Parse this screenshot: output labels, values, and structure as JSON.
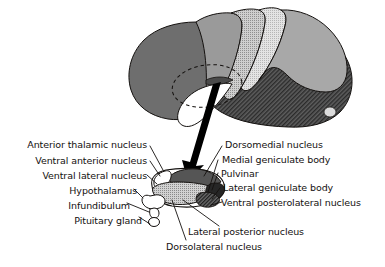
{
  "figure": {
    "type": "anatomical-illustration",
    "background_color": "#ffffff",
    "ink_color": "#14110f"
  },
  "brain": {
    "name": "lateral view of cerebral hemisphere",
    "callout_marker": "dashed ellipse over thalamus region",
    "pointer": "thick black arrow from brain to thalamus detail",
    "regions": [
      {
        "name": "frontal-lobe",
        "fill": "#6e6e6e"
      },
      {
        "name": "premotor-band",
        "fill": "#9a9a9a"
      },
      {
        "name": "precentral-band",
        "fill": "#c2c2c2"
      },
      {
        "name": "postcentral-band",
        "fill": "#dedede"
      },
      {
        "name": "parietal-lobe",
        "fill": "#a8a8a8"
      },
      {
        "name": "occipital-temporal-hatched",
        "fill": "#4a4a4a"
      },
      {
        "name": "brainstem-white",
        "fill": "#ffffff"
      }
    ]
  },
  "thalamus": {
    "name": "thalamus detail",
    "parts": [
      {
        "name": "dorsomedial-nucleus",
        "fill": "#5a5a5a"
      },
      {
        "name": "anterior-thalamic-nucleus",
        "fill": "#ffffff"
      },
      {
        "name": "ventral-lateral-nucleus",
        "fill": "#b8b8b8"
      },
      {
        "name": "lateral-posterior-nucleus",
        "fill": "#cfcfcf"
      },
      {
        "name": "pulvinar",
        "fill": "#2a2a2a"
      },
      {
        "name": "geniculate-bodies",
        "fill": "#3a3a3a"
      },
      {
        "name": "hypothalamus",
        "fill": "#ffffff"
      },
      {
        "name": "infundibulum",
        "fill": "#ffffff"
      },
      {
        "name": "pituitary-gland",
        "fill": "#ffffff"
      }
    ]
  },
  "labels_left": [
    {
      "id": "anterior-thalamic-nucleus",
      "text": "Anterior thalamic nucleus"
    },
    {
      "id": "ventral-anterior-nucleus",
      "text": "Ventral anterior nucleus"
    },
    {
      "id": "ventral-lateral-nucleus",
      "text": "Ventral lateral nucleus"
    },
    {
      "id": "hypothalamus",
      "text": "Hypothalamus"
    },
    {
      "id": "infundibulum",
      "text": "Infundibulum"
    },
    {
      "id": "pituitary-gland",
      "text": "Pituitary gland"
    }
  ],
  "labels_right": [
    {
      "id": "dorsomedial-nucleus",
      "text": "Dorsomedial nucleus"
    },
    {
      "id": "medial-geniculate-body",
      "text": "Medial geniculate body"
    },
    {
      "id": "pulvinar",
      "text": "Pulvinar"
    },
    {
      "id": "lateral-geniculate-body",
      "text": "Lateral geniculate body"
    },
    {
      "id": "ventral-posterolateral-nucleus",
      "text": "Ventral posterolateral nucleus"
    },
    {
      "id": "lateral-posterior-nucleus",
      "text": "Lateral posterior nucleus"
    },
    {
      "id": "dorsolateral-nucleus",
      "text": "Dorsolateral nucleus"
    }
  ]
}
